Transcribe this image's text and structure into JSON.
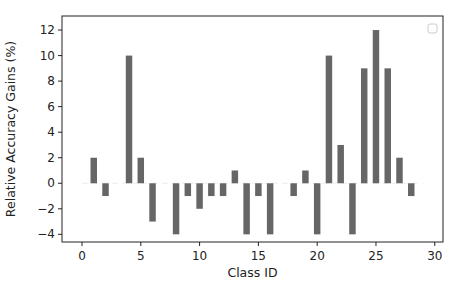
{
  "chart_data": {
    "type": "bar",
    "title": "",
    "xlabel": "Class ID",
    "ylabel": "Relative Accuracy Gains (%)",
    "xlim": [
      -1.7,
      30.7
    ],
    "ylim": [
      -4.6,
      13.1
    ],
    "xticks": [
      0,
      5,
      10,
      15,
      20,
      25,
      30
    ],
    "yticks": [
      -4,
      -2,
      0,
      2,
      4,
      6,
      8,
      10,
      12
    ],
    "grid": false,
    "legend": {
      "position": "upper right",
      "entries": []
    },
    "bar_color": "#666666",
    "x": [
      1,
      2,
      4,
      5,
      6,
      8,
      9,
      10,
      11,
      12,
      13,
      14,
      15,
      16,
      18,
      19,
      20,
      21,
      22,
      23,
      24,
      25,
      26,
      27,
      28
    ],
    "values": [
      2,
      -1,
      10,
      2,
      -3,
      -4,
      -1,
      -2,
      -1,
      -1,
      1,
      -4,
      -1,
      -4,
      -1,
      1,
      -4,
      10,
      3,
      -4,
      9,
      12,
      9,
      2,
      -1
    ]
  },
  "layout": {
    "plot_left": 62,
    "plot_right": 443,
    "plot_top": 16,
    "plot_bottom": 242
  }
}
